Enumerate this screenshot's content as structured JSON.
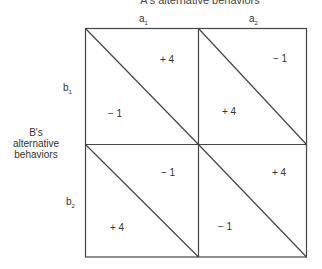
{
  "diagram": {
    "type": "payoff-matrix",
    "title": "A's alternative behaviors",
    "row_axis_title": [
      "B's",
      "alternative",
      "behaviors"
    ],
    "columns": [
      {
        "base": "a",
        "sub": "1"
      },
      {
        "base": "a",
        "sub": "2"
      }
    ],
    "rows": [
      {
        "base": "b",
        "sub": "1"
      },
      {
        "base": "b",
        "sub": "2"
      }
    ],
    "cells": [
      {
        "row": "b1",
        "col": "a1",
        "upper_right": "+ 4",
        "lower_left": "− 1"
      },
      {
        "row": "b1",
        "col": "a2",
        "upper_right": "− 1",
        "lower_left": "+ 4"
      },
      {
        "row": "b2",
        "col": "a1",
        "upper_right": "− 1",
        "lower_left": "+ 4"
      },
      {
        "row": "b2",
        "col": "a2",
        "upper_right": "+ 4",
        "lower_left": "− 1"
      }
    ],
    "line_color": "#444444"
  }
}
